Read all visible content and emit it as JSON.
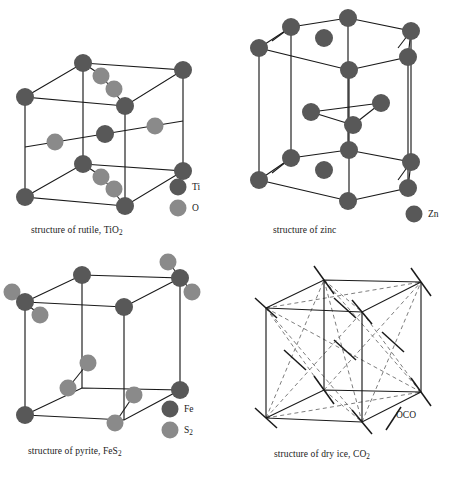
{
  "figure": {
    "background_color": "#ffffff",
    "atom_dark_color": "#585858",
    "atom_light_color": "#8a8a8a",
    "line_color": "#1a1a1a",
    "dash_color": "#6e6e6e"
  },
  "panels": {
    "rutile": {
      "caption_prefix": "structure of rutile, TiO",
      "caption_sub": "2",
      "legend": [
        {
          "label": "Ti",
          "color": "#585858",
          "kind": "sphere-dark"
        },
        {
          "label": "O",
          "color": "#8a8a8a",
          "kind": "sphere-light"
        }
      ]
    },
    "zinc": {
      "caption_prefix": "structure of zinc",
      "caption_sub": "",
      "legend": [
        {
          "label": "Zn",
          "color": "#585858",
          "kind": "sphere-dark"
        }
      ]
    },
    "pyrite": {
      "caption_prefix": "structure of pyrite, FeS",
      "caption_sub": "2",
      "legend": [
        {
          "label": "Fe",
          "color": "#585858",
          "kind": "sphere-dark"
        },
        {
          "label": "S",
          "label_sub": "2",
          "color": "#8a8a8a",
          "kind": "sphere-light"
        }
      ]
    },
    "dryice": {
      "caption_prefix": "structure of dry ice, CO",
      "caption_sub": "2",
      "legend": [
        {
          "label": "OCO",
          "kind": "line-segment"
        }
      ]
    }
  },
  "legend_text": {
    "ti": "Ti",
    "o": "O",
    "zn": "Zn",
    "fe": "Fe",
    "s": "S",
    "s_sub": "2",
    "oco": "OCO"
  },
  "captions": {
    "rutile_prefix": "structure of rutile, TiO",
    "rutile_sub": "2",
    "zinc": "structure of zinc",
    "pyrite_prefix": "structure of pyrite, FeS",
    "pyrite_sub": "2",
    "dryice_prefix": "structure of dry ice, CO",
    "dryice_sub": "2"
  }
}
